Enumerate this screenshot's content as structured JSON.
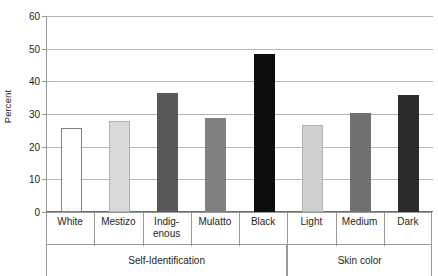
{
  "chart_data": {
    "type": "bar",
    "title": "",
    "xlabel": "",
    "ylabel": "Percent",
    "ylim": [
      0,
      60
    ],
    "yticks": [
      0,
      10,
      20,
      30,
      40,
      50,
      60
    ],
    "ytick_labels": [
      "0",
      "10",
      "20",
      "30",
      "40",
      "50",
      "60"
    ],
    "grid": true,
    "legend": "none",
    "categories": [
      "White",
      "Mestizo",
      "Indig-enous",
      "Mulatto",
      "Black",
      "Light",
      "Medium",
      "Dark"
    ],
    "category_labels": [
      {
        "line1": "White",
        "line2": ""
      },
      {
        "line1": "Mestizo",
        "line2": ""
      },
      {
        "line1": "Indig-",
        "line2": "enous"
      },
      {
        "line1": "Mulatto",
        "line2": ""
      },
      {
        "line1": "Black",
        "line2": ""
      },
      {
        "line1": "Light",
        "line2": ""
      },
      {
        "line1": "Medium",
        "line2": ""
      },
      {
        "line1": "Dark",
        "line2": ""
      }
    ],
    "values": [
      25.8,
      27.9,
      36.5,
      28.8,
      48.3,
      26.5,
      30.2,
      35.8
    ],
    "bar_colors": [
      "#ffffff",
      "#d9d9d9",
      "#595959",
      "#808080",
      "#0d0d0d",
      "#d0d0d0",
      "#707070",
      "#2b2b2b"
    ],
    "bar_border_colors": [
      "#808080",
      "#b0b0b0",
      "#595959",
      "#808080",
      "#0d0d0d",
      "#b0b0b0",
      "#707070",
      "#2b2b2b"
    ],
    "groups": [
      {
        "label": "Self-Identification",
        "categories": [
          "White",
          "Mestizo",
          "Indig-enous",
          "Mulatto",
          "Black"
        ]
      },
      {
        "label": "Skin color",
        "categories": [
          "Light",
          "Medium",
          "Dark"
        ]
      }
    ],
    "group_labels": [
      "Self-Identification",
      "Skin color"
    ],
    "colors": {
      "gridline": "#b3b3b3",
      "axis": "#9a9a9a",
      "text": "#231f20",
      "background": "#ffffff"
    }
  }
}
